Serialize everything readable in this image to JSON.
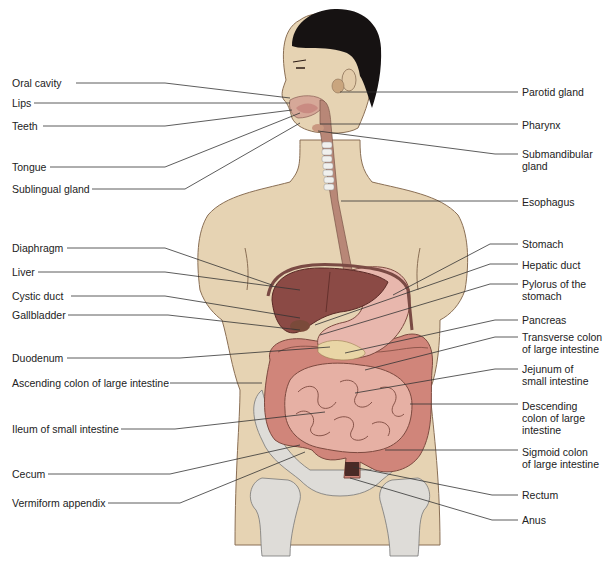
{
  "colors": {
    "skin": "#e6d3b3",
    "skin_outline": "#8a6f55",
    "hair": "#161212",
    "liver": "#8b4a45",
    "stomach": "#e8b7ad",
    "intestine": "#d8978a",
    "colon": "#d0857a",
    "pancreas": "#e9d6a6",
    "bone": "#dedcd8",
    "esophagus": "#b88777",
    "trachea": "#f0f0ee",
    "leader_line": "#333333"
  },
  "labels_left": [
    {
      "id": "oral-cavity",
      "text": "Oral cavity",
      "x": 12,
      "y": 77
    },
    {
      "id": "lips",
      "text": "Lips",
      "x": 12,
      "y": 97
    },
    {
      "id": "teeth",
      "text": "Teeth",
      "x": 12,
      "y": 120
    },
    {
      "id": "tongue",
      "text": "Tongue",
      "x": 12,
      "y": 161
    },
    {
      "id": "sublingual-gland",
      "text": "Sublingual gland",
      "x": 12,
      "y": 183
    },
    {
      "id": "diaphragm",
      "text": "Diaphragm",
      "x": 12,
      "y": 242
    },
    {
      "id": "liver",
      "text": "Liver",
      "x": 12,
      "y": 266
    },
    {
      "id": "cystic-duct",
      "text": "Cystic duct",
      "x": 12,
      "y": 290
    },
    {
      "id": "gallbladder",
      "text": "Gallbladder",
      "x": 12,
      "y": 309
    },
    {
      "id": "duodenum",
      "text": "Duodenum",
      "x": 12,
      "y": 352
    },
    {
      "id": "ascending-colon",
      "text": "Ascending colon of large intestine",
      "x": 12,
      "y": 377
    },
    {
      "id": "ileum",
      "text": "Ileum of small intestine",
      "x": 12,
      "y": 423
    },
    {
      "id": "cecum",
      "text": "Cecum",
      "x": 12,
      "y": 468
    },
    {
      "id": "vermiform-appendix",
      "text": "Vermiform appendix",
      "x": 12,
      "y": 497
    }
  ],
  "labels_right": [
    {
      "id": "parotid-gland",
      "text": "Parotid gland",
      "x": 522,
      "y": 86
    },
    {
      "id": "pharynx",
      "text": "Pharynx",
      "x": 522,
      "y": 119
    },
    {
      "id": "submandibular-gland",
      "text": "Submandibular\ngland",
      "x": 522,
      "y": 148
    },
    {
      "id": "esophagus",
      "text": "Esophagus",
      "x": 522,
      "y": 196
    },
    {
      "id": "stomach",
      "text": "Stomach",
      "x": 522,
      "y": 238
    },
    {
      "id": "hepatic-duct",
      "text": "Hepatic duct",
      "x": 522,
      "y": 259
    },
    {
      "id": "pylorus",
      "text": "Pylorus of the\nstomach",
      "x": 522,
      "y": 278
    },
    {
      "id": "pancreas",
      "text": "Pancreas",
      "x": 522,
      "y": 314
    },
    {
      "id": "transverse-colon",
      "text": "Transverse colon\nof large intestine",
      "x": 522,
      "y": 331
    },
    {
      "id": "jejunum",
      "text": "Jejunum of\nsmall intestine",
      "x": 522,
      "y": 363
    },
    {
      "id": "descending-colon",
      "text": "Descending\ncolon of large\nintestine",
      "x": 522,
      "y": 400
    },
    {
      "id": "sigmoid-colon",
      "text": "Sigmoid colon\nof large intestine",
      "x": 522,
      "y": 446
    },
    {
      "id": "rectum",
      "text": "Rectum",
      "x": 522,
      "y": 489
    },
    {
      "id": "anus",
      "text": "Anus",
      "x": 522,
      "y": 514
    }
  ],
  "leaders_left": [
    {
      "id": "oral-cavity",
      "pts": "76,83 165,83 290,98"
    },
    {
      "id": "lips",
      "pts": "34,103 290,103"
    },
    {
      "id": "teeth",
      "pts": "43,126 165,126 292,110"
    },
    {
      "id": "tongue",
      "pts": "50,167 165,167 300,113"
    },
    {
      "id": "sublingual-gland",
      "pts": "92,189 185,189 300,123"
    },
    {
      "id": "diaphragm",
      "pts": "67,248 165,248 272,285"
    },
    {
      "id": "liver",
      "pts": "38,272 165,272 300,290"
    },
    {
      "id": "cystic-duct",
      "pts": "71,296 165,296 300,318"
    },
    {
      "id": "gallbladder",
      "pts": "68,315 168,315 300,330"
    },
    {
      "id": "duodenum",
      "pts": "67,358 180,358 330,347"
    },
    {
      "id": "ascending-colon",
      "pts": "170,383 262,383"
    },
    {
      "id": "ileum",
      "pts": "121,429 175,429 325,412"
    },
    {
      "id": "cecum",
      "pts": "48,474 170,474 300,445"
    },
    {
      "id": "vermiform-appendix",
      "pts": "108,503 180,503 305,452"
    }
  ],
  "leaders_right": [
    {
      "id": "parotid-gland",
      "pts": "340,92 518,92"
    },
    {
      "id": "pharynx",
      "pts": "320,124 518,124"
    },
    {
      "id": "submandibular-gland",
      "pts": "318,131 495,154 518,154"
    },
    {
      "id": "esophagus",
      "pts": "341,201 518,201"
    },
    {
      "id": "stomach",
      "pts": "393,295 490,244 518,244"
    },
    {
      "id": "hepatic-duct",
      "pts": "315,325 490,264 518,264"
    },
    {
      "id": "pylorus",
      "pts": "320,335 490,284 518,284"
    },
    {
      "id": "pancreas",
      "pts": "345,353 495,320 518,320"
    },
    {
      "id": "transverse-colon",
      "pts": "365,370 495,337 518,337"
    },
    {
      "id": "jejunum",
      "pts": "355,393 495,369 518,369"
    },
    {
      "id": "descending-colon",
      "pts": "410,404 518,404"
    },
    {
      "id": "sigmoid-colon",
      "pts": "385,450 518,450"
    },
    {
      "id": "rectum",
      "pts": "353,467 492,495 518,495"
    },
    {
      "id": "anus",
      "pts": "350,478 492,520 518,520"
    }
  ]
}
